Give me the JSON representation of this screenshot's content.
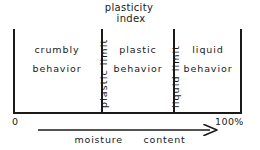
{
  "diagram": {
    "title_lines": [
      "plasticity",
      "index"
    ],
    "regions": [
      {
        "name": "crumbly-behavior",
        "line1": "crumbly",
        "line2": "behavior"
      },
      {
        "name": "plastic-behavior",
        "line1": "plastic",
        "line2": "behavior"
      },
      {
        "name": "liquid-behavior",
        "line1": "liquid",
        "line2": "behavior"
      }
    ],
    "boundaries": [
      {
        "name": "plastic-limit",
        "label": "plastic limit"
      },
      {
        "name": "liquid-limit",
        "label": "liquid limit"
      }
    ],
    "axis": {
      "start_label": "0",
      "end_label": "100%",
      "arrow_caption_left": "moisture",
      "arrow_caption_right": "content"
    },
    "colors": {
      "ink": "#1a1a1a",
      "background": "#ffffff"
    }
  }
}
